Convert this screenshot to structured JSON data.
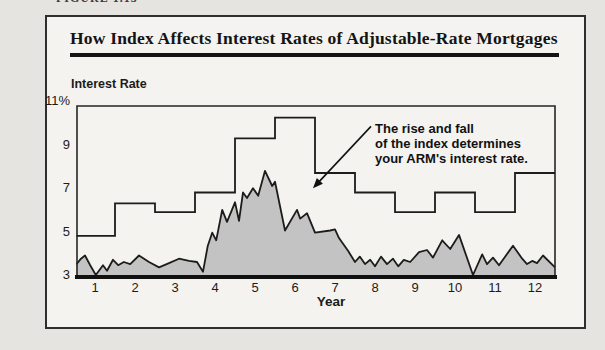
{
  "figure": {
    "label": "FIGURE 1.13",
    "title": "How Index Affects Interest Rates of Adjustable-Rate Mortgages"
  },
  "chart_data": {
    "type": "line",
    "title": "How Index Affects Interest Rates of Adjustable-Rate Mortgages",
    "ylabel": "Interest Rate",
    "xlabel": "Year",
    "xlim": [
      0.5,
      12.5
    ],
    "ylim": [
      3,
      11
    ],
    "grid": false,
    "legend": false,
    "x_ticks": [
      1,
      2,
      3,
      4,
      5,
      6,
      7,
      8,
      9,
      10,
      11,
      12
    ],
    "y_ticks": [
      {
        "value": 3,
        "label": "3"
      },
      {
        "value": 5,
        "label": "5"
      },
      {
        "value": 7,
        "label": "7"
      },
      {
        "value": 9,
        "label": "9"
      },
      {
        "value": 11,
        "label": "11%"
      }
    ],
    "colors": {
      "line": "#1c1c1c",
      "index_fill": "#c3c3c3",
      "frame": "#262626"
    },
    "series": [
      {
        "name": "ARM interest rate",
        "type": "step",
        "steps": [
          {
            "from": 0.5,
            "to": 1.5,
            "rate": 4.8
          },
          {
            "from": 1.5,
            "to": 2.5,
            "rate": 6.3
          },
          {
            "from": 2.5,
            "to": 3.5,
            "rate": 5.9
          },
          {
            "from": 3.5,
            "to": 4.5,
            "rate": 6.8
          },
          {
            "from": 4.5,
            "to": 5.5,
            "rate": 9.3
          },
          {
            "from": 5.5,
            "to": 6.5,
            "rate": 10.25
          },
          {
            "from": 6.5,
            "to": 7.5,
            "rate": 7.7
          },
          {
            "from": 7.5,
            "to": 8.5,
            "rate": 6.8
          },
          {
            "from": 8.5,
            "to": 9.5,
            "rate": 5.9
          },
          {
            "from": 9.5,
            "to": 10.5,
            "rate": 6.8
          },
          {
            "from": 10.5,
            "to": 11.5,
            "rate": 5.9
          },
          {
            "from": 11.5,
            "to": 12.5,
            "rate": 7.7
          }
        ]
      },
      {
        "name": "Index",
        "type": "area",
        "points": [
          [
            0.5,
            3.5
          ],
          [
            0.65,
            3.75
          ],
          [
            0.75,
            3.9
          ],
          [
            0.88,
            3.45
          ],
          [
            1.02,
            3.0
          ],
          [
            1.2,
            3.45
          ],
          [
            1.3,
            3.2
          ],
          [
            1.45,
            3.7
          ],
          [
            1.58,
            3.45
          ],
          [
            1.72,
            3.6
          ],
          [
            1.88,
            3.5
          ],
          [
            2.1,
            3.9
          ],
          [
            2.35,
            3.6
          ],
          [
            2.6,
            3.35
          ],
          [
            2.85,
            3.55
          ],
          [
            3.1,
            3.75
          ],
          [
            3.35,
            3.65
          ],
          [
            3.55,
            3.6
          ],
          [
            3.7,
            3.15
          ],
          [
            3.82,
            4.35
          ],
          [
            3.93,
            4.95
          ],
          [
            4.03,
            4.6
          ],
          [
            4.18,
            6.0
          ],
          [
            4.3,
            5.45
          ],
          [
            4.5,
            6.35
          ],
          [
            4.6,
            5.5
          ],
          [
            4.7,
            6.8
          ],
          [
            4.8,
            6.55
          ],
          [
            4.95,
            7.0
          ],
          [
            5.08,
            6.65
          ],
          [
            5.25,
            7.8
          ],
          [
            5.43,
            7.1
          ],
          [
            5.5,
            7.3
          ],
          [
            5.75,
            5.05
          ],
          [
            6.05,
            6.0
          ],
          [
            6.13,
            5.6
          ],
          [
            6.3,
            5.85
          ],
          [
            6.5,
            4.95
          ],
          [
            6.88,
            5.05
          ],
          [
            7.0,
            5.1
          ],
          [
            7.1,
            4.7
          ],
          [
            7.33,
            4.1
          ],
          [
            7.5,
            3.6
          ],
          [
            7.62,
            3.85
          ],
          [
            7.75,
            3.5
          ],
          [
            7.88,
            3.7
          ],
          [
            8.0,
            3.4
          ],
          [
            8.15,
            3.85
          ],
          [
            8.3,
            3.5
          ],
          [
            8.45,
            3.75
          ],
          [
            8.58,
            3.4
          ],
          [
            8.72,
            3.7
          ],
          [
            8.88,
            3.6
          ],
          [
            9.1,
            4.05
          ],
          [
            9.3,
            4.15
          ],
          [
            9.45,
            3.8
          ],
          [
            9.68,
            4.6
          ],
          [
            9.88,
            4.2
          ],
          [
            10.1,
            4.85
          ],
          [
            10.45,
            3.0
          ],
          [
            10.68,
            3.95
          ],
          [
            10.8,
            3.5
          ],
          [
            10.95,
            3.8
          ],
          [
            11.1,
            3.45
          ],
          [
            11.45,
            4.35
          ],
          [
            11.68,
            3.75
          ],
          [
            11.8,
            3.5
          ],
          [
            11.93,
            3.65
          ],
          [
            12.05,
            3.55
          ],
          [
            12.2,
            3.9
          ],
          [
            12.5,
            3.35
          ]
        ]
      }
    ],
    "annotation": {
      "lines": [
        "The rise and fall",
        "of the index determines",
        "your ARM's interest rate."
      ],
      "text_year": 8.0,
      "text_rate": 10.1,
      "arrow": {
        "from_year": 7.9,
        "from_rate": 9.85,
        "to_year": 6.45,
        "to_rate": 7.0
      }
    }
  }
}
